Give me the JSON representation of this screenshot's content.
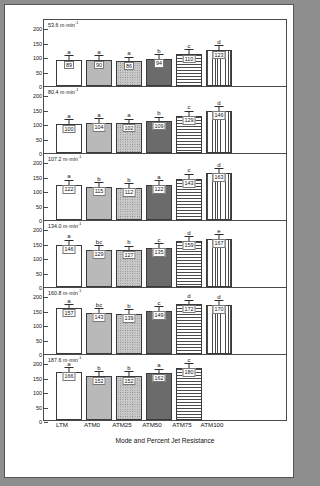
{
  "figure": {
    "xlabel": "Mode and Percent Jet Resistance",
    "ylabel": "HR (bpm)"
  },
  "chart_data": {
    "type": "bar",
    "title": "",
    "xlabel": "Mode and Percent Jet Resistance",
    "ylabel": "HR (bpm)",
    "ylim": [
      0,
      200
    ],
    "yticks": [
      0,
      50,
      100,
      150,
      200
    ],
    "grid": false,
    "legend": "none",
    "categories": [
      "LTM",
      "ATM0",
      "ATM25",
      "ATM50",
      "ATM75",
      "ATM100"
    ],
    "panels": [
      {
        "speed": "53.6 m·min",
        "speed_exp": "-1",
        "values": [
          89,
          90,
          86,
          94,
          110,
          123
        ],
        "errors": [
          14,
          12,
          12,
          12,
          13,
          14
        ],
        "letters": [
          "a",
          "a",
          "a",
          "b",
          "c",
          "d"
        ]
      },
      {
        "speed": "80.4 m·min",
        "speed_exp": "-1",
        "values": [
          100,
          104,
          102,
          109,
          129,
          146
        ],
        "errors": [
          13,
          12,
          12,
          12,
          13,
          12
        ],
        "letters": [
          "a",
          "a",
          "a",
          "b",
          "c",
          "d"
        ]
      },
      {
        "speed": "107.2 m·min",
        "speed_exp": "-1",
        "values": [
          122,
          115,
          112,
          122,
          143,
          163
        ],
        "errors": [
          14,
          12,
          12,
          12,
          13,
          12
        ],
        "letters": [
          "a",
          "b",
          "b",
          "a",
          "c",
          "d"
        ]
      },
      {
        "speed": "134.0 m·min",
        "speed_exp": "-1",
        "values": [
          146,
          129,
          127,
          135,
          159,
          167
        ],
        "errors": [
          14,
          12,
          12,
          12,
          12,
          12
        ],
        "letters": [
          "a",
          "bc",
          "b",
          "c",
          "d",
          "e"
        ]
      },
      {
        "speed": "160.8 m·min",
        "speed_exp": "-1",
        "values": [
          157,
          143,
          139,
          149,
          172,
          170
        ],
        "errors": [
          12,
          12,
          12,
          12,
          12,
          12
        ],
        "letters": [
          "a",
          "bc",
          "b",
          "c",
          "d",
          "d"
        ]
      },
      {
        "speed": "187.6 m·min",
        "speed_exp": "-1",
        "values": [
          166,
          152,
          152,
          162,
          180,
          null
        ],
        "errors": [
          13,
          12,
          12,
          12,
          12,
          null
        ],
        "letters": [
          "a",
          "b",
          "b",
          "a",
          "c",
          null
        ]
      }
    ]
  }
}
